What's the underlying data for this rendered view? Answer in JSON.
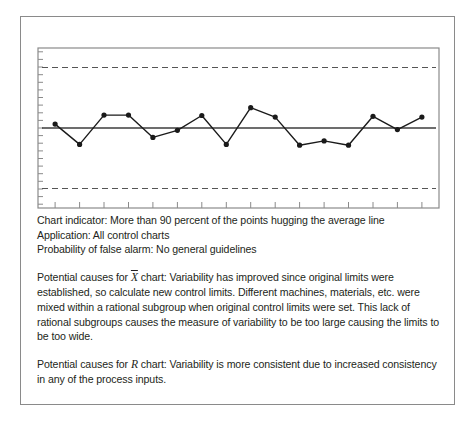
{
  "figure": {
    "border_color": "#8a8a8a",
    "background": "#ffffff"
  },
  "chart_data": {
    "type": "line",
    "title": "",
    "xlabel": "",
    "ylabel": "",
    "subtitle": "",
    "grid": false,
    "legend": null,
    "x": [
      1,
      2,
      3,
      4,
      5,
      6,
      7,
      8,
      9,
      10,
      11,
      12,
      13,
      14,
      15,
      16
    ],
    "values": [
      0.1,
      -0.42,
      0.33,
      0.33,
      -0.24,
      -0.06,
      0.32,
      -0.42,
      0.52,
      0.28,
      -0.44,
      -0.33,
      -0.44,
      0.3,
      -0.04,
      0.28
    ],
    "series": [
      {
        "name": "Individual values",
        "values": [
          0.1,
          -0.42,
          0.33,
          0.33,
          -0.24,
          -0.06,
          0.32,
          -0.42,
          0.52,
          0.28,
          -0.44,
          -0.33,
          -0.44,
          0.3,
          -0.04,
          0.28
        ],
        "color": "#1a1a1a",
        "marker": "circle"
      }
    ],
    "reference_lines": [
      {
        "name": "UCL",
        "label": "",
        "value": 1.55,
        "style": "dashed",
        "color": "#555555"
      },
      {
        "name": "center-line",
        "label": "",
        "value": 0.0,
        "style": "solid",
        "color": "#3c3c3c"
      },
      {
        "name": "LCL",
        "label": "",
        "value": -1.55,
        "style": "dashed",
        "color": "#555555"
      }
    ],
    "ylim": [
      -2.05,
      2.05
    ],
    "xlim": [
      0.3,
      16.7
    ],
    "x_tick_count": 16,
    "y_tick_count": 21,
    "axis_color": "#8a8a8a",
    "tick_labels_x": [],
    "tick_labels_y": []
  },
  "indicator_block": {
    "line1": "Chart indicator: More than 90 percent of the points hugging the average line",
    "line2": "Application: All control charts",
    "line3": "Probability of false alarm: No general guidelines"
  },
  "xbar_paragraph": {
    "prefix": "Potential causes for ",
    "symbol": "X",
    "body": " chart: Variability has improved since original limits were established, so calculate new control limits. Different machines, materials, etc. were mixed within a rational subgroup when original control limits were set. This lack of rational subgroups causes the measure of variability to be too large causing the limits to be too wide."
  },
  "r_paragraph": {
    "prefix": "Potential causes for ",
    "symbol": "R",
    "body": " chart: Variability is more consistent due to increased consistency in any of the process inputs."
  }
}
